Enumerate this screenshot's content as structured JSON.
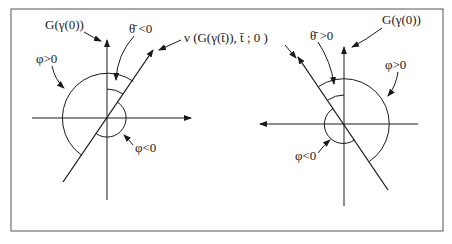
{
  "figure": {
    "left_panel": {
      "axis_label_vertical": "G(γ(0))",
      "theta_label": "θ̄ <0",
      "phi_pos_label": "φ>0",
      "phi_neg_label": "φ<0"
    },
    "right_panel": {
      "axis_label_vertical": "G(γ(0))",
      "theta_label": "θ̄ >0",
      "phi_pos_label": "φ>0",
      "phi_neg_label": "φ<0"
    },
    "shared_label": "ν (G(γ(t̄)), t̄ ; 0 )",
    "colors": {
      "line": "#1a1a1a",
      "frame": "#555555",
      "background": "#ffffff"
    }
  }
}
